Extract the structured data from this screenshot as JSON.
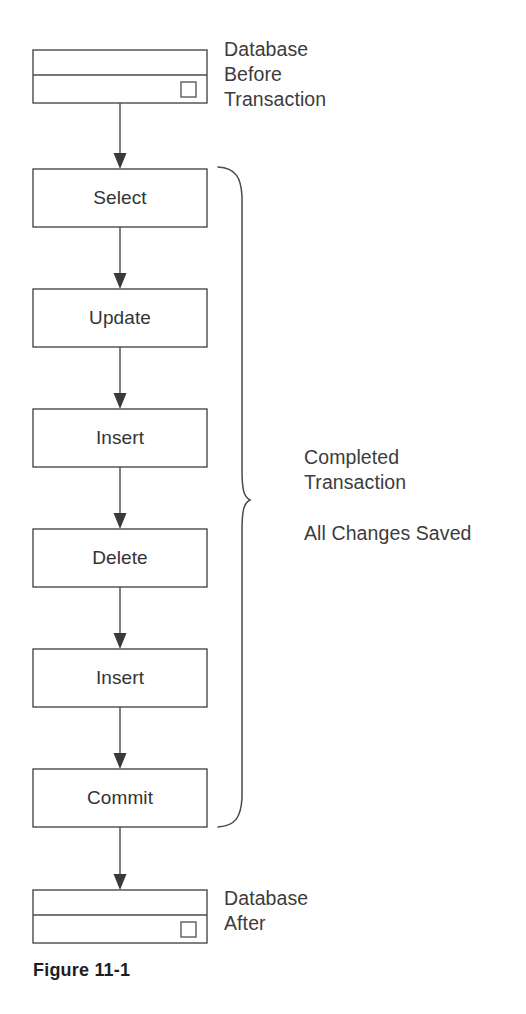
{
  "figure": {
    "caption": "Figure 11-1",
    "type": "flowchart-diagram",
    "line_color": "#4a4a4a",
    "text_color": "#3a3a3a",
    "background_color": "#ffffff"
  },
  "top_database": {
    "icon_name": "database-cylinder-box",
    "annotation_lines": [
      "Database",
      "Before",
      "Transaction"
    ]
  },
  "bottom_database": {
    "icon_name": "database-cylinder-box",
    "annotation_lines": [
      "Database",
      "After"
    ]
  },
  "steps": [
    {
      "label": "Select"
    },
    {
      "label": "Update"
    },
    {
      "label": "Insert"
    },
    {
      "label": "Delete"
    },
    {
      "label": "Insert"
    },
    {
      "label": "Commit"
    }
  ],
  "brace_annotation": {
    "group_lines": [
      "Completed",
      "Transaction"
    ],
    "result_lines": [
      "All Changes Saved"
    ]
  }
}
